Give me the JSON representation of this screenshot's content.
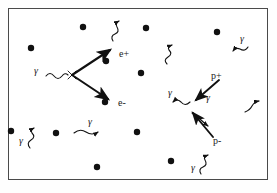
{
  "diagram": {
    "style": {
      "ink": "#1a1a1a",
      "frame_stroke": "#4a4a4a",
      "background": "#ffffff",
      "dot_fill": "#111111"
    },
    "frame": {
      "x": 8,
      "y": 8,
      "width": 260,
      "height": 172
    },
    "dots": [
      {
        "name": "dot-1",
        "cx": 83,
        "cy": 27,
        "r": 3.2
      },
      {
        "name": "dot-2",
        "cx": 146,
        "cy": 28,
        "r": 3.2
      },
      {
        "name": "dot-3",
        "cx": 217,
        "cy": 32,
        "r": 3.2
      },
      {
        "name": "dot-4",
        "cx": 31,
        "cy": 48,
        "r": 3.2
      },
      {
        "name": "dot-5",
        "cx": 106,
        "cy": 61,
        "r": 3.2
      },
      {
        "name": "dot-6",
        "cx": 141,
        "cy": 73,
        "r": 3.2
      },
      {
        "name": "dot-7",
        "cx": 105,
        "cy": 102,
        "r": 3.2
      },
      {
        "name": "dot-8",
        "cx": 11,
        "cy": 131,
        "r": 3.2
      },
      {
        "name": "dot-9",
        "cx": 56,
        "cy": 133,
        "r": 3.2
      },
      {
        "name": "dot-10",
        "cx": 137,
        "cy": 132,
        "r": 3.2
      },
      {
        "name": "dot-11",
        "cx": 97,
        "cy": 167,
        "r": 3.2
      },
      {
        "name": "dot-12",
        "cx": 171,
        "cy": 161,
        "r": 3.2
      }
    ],
    "labels": [
      {
        "name": "label-electron-positive",
        "text": "e+",
        "x": 119,
        "y": 56,
        "kind": "particle"
      },
      {
        "name": "label-electron-negative",
        "text": "e-",
        "x": 118,
        "y": 104,
        "kind": "particle"
      },
      {
        "name": "label-proton-positive",
        "text": "p+",
        "x": 210,
        "y": 78,
        "kind": "particle"
      },
      {
        "name": "label-proton-negative",
        "text": "p-",
        "x": 212,
        "y": 142,
        "kind": "particle"
      },
      {
        "name": "label-gamma-incoming",
        "text": "γ",
        "x": 36,
        "y": 72,
        "kind": "gamma"
      },
      {
        "name": "label-gamma-top-right",
        "text": "γ",
        "x": 241,
        "y": 40,
        "kind": "gamma"
      },
      {
        "name": "label-gamma-annih-left",
        "text": "γ",
        "x": 172,
        "y": 93,
        "kind": "gamma"
      },
      {
        "name": "label-gamma-annih-right",
        "text": "γ",
        "x": 209,
        "y": 99,
        "kind": "gamma"
      },
      {
        "name": "label-gamma-mid",
        "text": "γ",
        "x": 89,
        "y": 122,
        "kind": "gamma"
      },
      {
        "name": "label-gamma-bottom-left",
        "text": "γ",
        "x": 19,
        "y": 139,
        "kind": "gamma"
      },
      {
        "name": "label-gamma-bottom-right",
        "text": "γ",
        "x": 193,
        "y": 168,
        "kind": "gamma"
      }
    ],
    "vertices": [
      {
        "name": "pair-production-vertex",
        "x": 72,
        "y": 75,
        "products": [
          "e+",
          "e-"
        ],
        "incoming": "gamma"
      },
      {
        "name": "annihilation-vertex",
        "x": 196,
        "y": 107,
        "incoming": [
          "p+",
          "p-"
        ],
        "products": [
          "gamma",
          "gamma"
        ]
      }
    ],
    "tracks": [
      {
        "name": "track-positron",
        "from": [
          72,
          75
        ],
        "to": [
          112,
          49
        ],
        "kind": "arrow"
      },
      {
        "name": "track-electron",
        "from": [
          72,
          75
        ],
        "to": [
          110,
          101
        ],
        "kind": "arrow"
      },
      {
        "name": "track-proton-positive",
        "from": [
          217,
          81
        ],
        "to": [
          194,
          101
        ],
        "kind": "arrow"
      },
      {
        "name": "track-proton-negative",
        "from": [
          211,
          136
        ],
        "to": [
          192,
          113
        ],
        "kind": "arrow"
      }
    ],
    "photons": [
      {
        "name": "photon-incoming-wave",
        "direction": "right"
      },
      {
        "name": "photon-top-center-wave",
        "direction": "up-right"
      },
      {
        "name": "photon-top-right-wave",
        "direction": "up-right"
      },
      {
        "name": "photon-far-top-right",
        "direction": "left"
      },
      {
        "name": "photon-annih-left",
        "direction": "left"
      },
      {
        "name": "photon-annih-right",
        "direction": "down-right"
      },
      {
        "name": "photon-right-wave",
        "direction": "up-right"
      },
      {
        "name": "photon-mid-wave",
        "direction": "right"
      },
      {
        "name": "photon-bottom-left",
        "direction": "up"
      },
      {
        "name": "photon-bottom-right",
        "direction": "up-right"
      }
    ]
  }
}
